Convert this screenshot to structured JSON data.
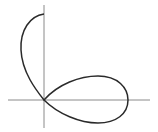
{
  "figure": {
    "type": "polar-curve-plot",
    "background": "#ffffff",
    "axis_color": "#8a8a8a",
    "curve_color": "#2a2a2a",
    "origin": {
      "x": 44,
      "y": 100
    },
    "axes": {
      "x_axis": {
        "from": 8,
        "to": 150
      },
      "y_axis": {
        "from": 5,
        "to": 128
      }
    },
    "curve": {
      "upper_arc": {
        "top_point": {
          "x": 44,
          "y": 14
        },
        "leftmost_x": 21
      },
      "right_loop": {
        "top_y": 76,
        "bottom_y": 123,
        "rightmost_x": 128
      }
    }
  }
}
